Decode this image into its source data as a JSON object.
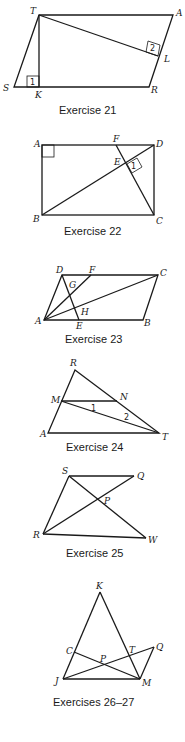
{
  "figures": [
    {
      "caption": "Exercise 21",
      "points": {
        "T": "T",
        "A": "A",
        "S": "S",
        "K": "K",
        "R": "R",
        "L": "L"
      },
      "angle_labels": [
        "1",
        "2"
      ]
    },
    {
      "caption": "Exercise 22",
      "points": {
        "A": "A",
        "F": "F",
        "D": "D",
        "E": "E",
        "B": "B",
        "C": "C"
      },
      "angle_labels": [
        "1"
      ]
    },
    {
      "caption": "Exercise 23",
      "points": {
        "D": "D",
        "F": "F",
        "C": "C",
        "G": "G",
        "H": "H",
        "A": "A",
        "E": "E",
        "B": "B"
      }
    },
    {
      "caption": "Exercise 24",
      "points": {
        "R": "R",
        "M": "M",
        "N": "N",
        "A": "A",
        "T": "T"
      },
      "angle_labels": [
        "1",
        "2"
      ]
    },
    {
      "caption": "Exercise 25",
      "points": {
        "S": "S",
        "Q": "Q",
        "P": "P",
        "R": "R",
        "W": "W"
      }
    },
    {
      "caption": "Exercises 26–27",
      "points": {
        "K": "K",
        "C": "C",
        "P": "P",
        "T": "T",
        "Q": "Q",
        "J": "J",
        "M": "M"
      }
    }
  ]
}
